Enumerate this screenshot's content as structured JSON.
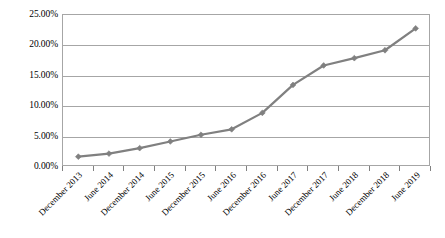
{
  "chart_data": {
    "type": "line",
    "title": "",
    "subtitle": "",
    "xlabel": "",
    "ylabel": "",
    "grid": true,
    "legend": false,
    "legend_position": "none",
    "series_color": "#808080",
    "axis_color": "#a6a6a6",
    "ylim": [
      0,
      25
    ],
    "ytick_labels": [
      "25.00%",
      "20.00%",
      "15.00%",
      "10.00%",
      "5.00%",
      "0.00%"
    ],
    "ytick_values": [
      25,
      20,
      15,
      10,
      5,
      0
    ],
    "categories": [
      "December 2013",
      "June 2014",
      "December 2014",
      "June 2015",
      "December 2015",
      "June 2016",
      "December 2016",
      "June 2017",
      "December 2017",
      "June 2018",
      "December 2018",
      "June 2019"
    ],
    "values": [
      1.7,
      2.2,
      3.1,
      4.2,
      5.3,
      6.2,
      8.9,
      13.5,
      16.7,
      17.9,
      19.2,
      22.8
    ],
    "series": [
      {
        "name": "Series 1",
        "values": [
          1.7,
          2.2,
          3.1,
          4.2,
          5.3,
          6.2,
          8.9,
          13.5,
          16.7,
          17.9,
          19.2,
          22.8
        ]
      }
    ]
  }
}
